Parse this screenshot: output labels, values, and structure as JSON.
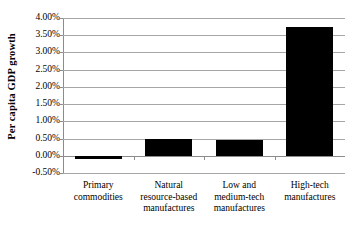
{
  "chart_data": {
    "type": "bar",
    "title": "",
    "xlabel": "",
    "ylabel": "Per capita GDP growth",
    "categories": [
      "Primary commodities",
      "Natural resource-based manufactures",
      "Low and medium-tech manufactures",
      "High-tech manufactures"
    ],
    "category_lines": [
      [
        "Primary",
        "commodities"
      ],
      [
        "Natural",
        "resource-based",
        "manufactures"
      ],
      [
        "Low and",
        "medium-tech",
        "manufactures"
      ],
      [
        "High-tech",
        "manufactures"
      ]
    ],
    "values": [
      -0.1,
      0.48,
      0.47,
      3.75
    ],
    "value_unit": "percent",
    "ylim": [
      -0.5,
      4.0
    ],
    "ytick_step": 0.5,
    "ytick_labels": [
      "4.00%",
      "3.50%",
      "3.00%",
      "2.50%",
      "2.00%",
      "1.50%",
      "1.00%",
      "0.50%",
      "0.00%",
      "-0.50%"
    ],
    "ytick_values": [
      4.0,
      3.5,
      3.0,
      2.5,
      2.0,
      1.5,
      1.0,
      0.5,
      0.0,
      -0.5
    ],
    "grid": true,
    "grid_orientation": "horizontal",
    "legend": false,
    "legend_position": "none",
    "bar_color": "#000000",
    "gridline_color": "#A6A6A6",
    "axis_color": "#8C8C8C",
    "background_color": "#FFFFFF"
  }
}
